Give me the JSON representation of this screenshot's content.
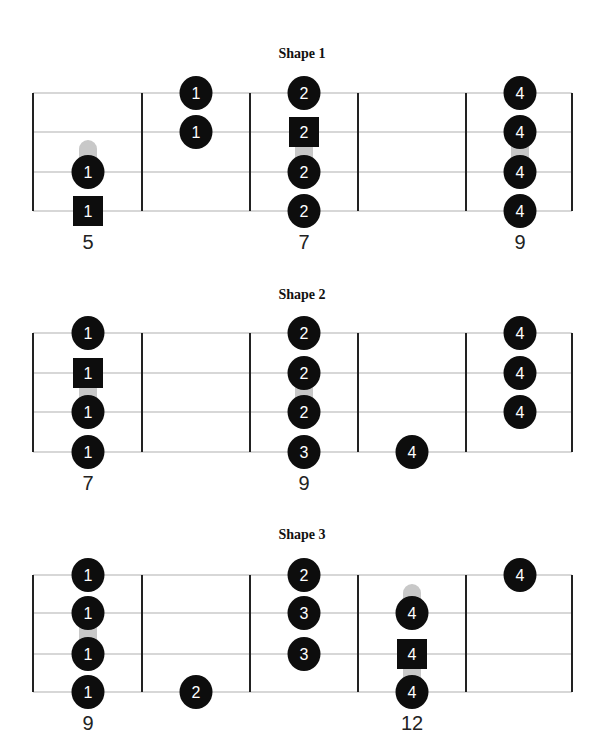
{
  "layout": {
    "fret_x": [
      33,
      142,
      250,
      358,
      466,
      572
    ],
    "column_x": [
      88,
      196,
      304,
      412,
      520
    ],
    "colors": {
      "note": "#0d0d0d",
      "string_line": "#b0b0b0",
      "fret_line": "#222222",
      "slide": "#c8c8c8",
      "note_text": "#ffffff"
    }
  },
  "diagrams": [
    {
      "title": "Shape 1",
      "title_y": 58,
      "strings_y": [
        93,
        132,
        172,
        211
      ],
      "fret_numbers": [
        {
          "col": 0,
          "label": "5"
        },
        {
          "col": 2,
          "label": "7"
        },
        {
          "col": 4,
          "label": "9"
        }
      ],
      "fret_number_y": 249,
      "notes": [
        {
          "col": 1,
          "string": 0,
          "finger": "1",
          "shape": "circle"
        },
        {
          "col": 1,
          "string": 1,
          "finger": "1",
          "shape": "circle"
        },
        {
          "col": 0,
          "string": 2,
          "finger": "1",
          "shape": "circle"
        },
        {
          "col": 0,
          "string": 3,
          "finger": "1",
          "shape": "square"
        },
        {
          "col": 2,
          "string": 0,
          "finger": "2",
          "shape": "circle"
        },
        {
          "col": 2,
          "string": 1,
          "finger": "2",
          "shape": "square"
        },
        {
          "col": 2,
          "string": 2,
          "finger": "2",
          "shape": "circle"
        },
        {
          "col": 2,
          "string": 3,
          "finger": "2",
          "shape": "circle"
        },
        {
          "col": 4,
          "string": 0,
          "finger": "4",
          "shape": "circle"
        },
        {
          "col": 4,
          "string": 1,
          "finger": "4",
          "shape": "circle"
        },
        {
          "col": 4,
          "string": 2,
          "finger": "4",
          "shape": "circle"
        },
        {
          "col": 4,
          "string": 3,
          "finger": "4",
          "shape": "circle"
        }
      ],
      "slides": [
        {
          "col": 0,
          "from_y": 148,
          "to_y": 165
        },
        {
          "col": 2,
          "from_y": 140,
          "to_y": 160
        },
        {
          "col": 4,
          "from_y": 140,
          "to_y": 160
        }
      ]
    },
    {
      "title": "Shape 2",
      "title_y": 299,
      "strings_y": [
        333,
        373,
        412,
        452
      ],
      "fret_numbers": [
        {
          "col": 0,
          "label": "7"
        },
        {
          "col": 2,
          "label": "9"
        }
      ],
      "fret_number_y": 490,
      "notes": [
        {
          "col": 0,
          "string": 0,
          "finger": "1",
          "shape": "circle"
        },
        {
          "col": 0,
          "string": 1,
          "finger": "1",
          "shape": "square"
        },
        {
          "col": 0,
          "string": 2,
          "finger": "1",
          "shape": "circle"
        },
        {
          "col": 0,
          "string": 3,
          "finger": "1",
          "shape": "circle"
        },
        {
          "col": 2,
          "string": 0,
          "finger": "2",
          "shape": "circle"
        },
        {
          "col": 2,
          "string": 1,
          "finger": "2",
          "shape": "circle"
        },
        {
          "col": 2,
          "string": 2,
          "finger": "2",
          "shape": "circle"
        },
        {
          "col": 2,
          "string": 3,
          "finger": "3",
          "shape": "circle"
        },
        {
          "col": 3,
          "string": 3,
          "finger": "4",
          "shape": "circle",
          "offset_y": 0
        },
        {
          "col": 4,
          "string": 0,
          "finger": "4",
          "shape": "circle"
        },
        {
          "col": 4,
          "string": 1,
          "finger": "4",
          "shape": "circle"
        },
        {
          "col": 4,
          "string": 2,
          "finger": "4",
          "shape": "circle"
        }
      ],
      "slides": [
        {
          "col": 0,
          "from_y": 385,
          "to_y": 400
        },
        {
          "col": 2,
          "from_y": 385,
          "to_y": 400
        }
      ]
    },
    {
      "title": "Shape 3",
      "title_y": 539,
      "strings_y": [
        575,
        613,
        654,
        692
      ],
      "fret_numbers": [
        {
          "col": 0,
          "label": "9"
        },
        {
          "col": 3,
          "label": "12"
        }
      ],
      "fret_number_y": 730,
      "notes": [
        {
          "col": 0,
          "string": 0,
          "finger": "1",
          "shape": "circle"
        },
        {
          "col": 0,
          "string": 1,
          "finger": "1",
          "shape": "circle"
        },
        {
          "col": 0,
          "string": 2,
          "finger": "1",
          "shape": "circle"
        },
        {
          "col": 0,
          "string": 3,
          "finger": "1",
          "shape": "circle"
        },
        {
          "col": 1,
          "string": 3,
          "finger": "2",
          "shape": "circle"
        },
        {
          "col": 2,
          "string": 0,
          "finger": "2",
          "shape": "circle"
        },
        {
          "col": 2,
          "string": 1,
          "finger": "3",
          "shape": "circle"
        },
        {
          "col": 2,
          "string": 2,
          "finger": "3",
          "shape": "circle"
        },
        {
          "col": 3,
          "string": 1,
          "finger": "4",
          "shape": "circle"
        },
        {
          "col": 3,
          "string": 2,
          "finger": "4",
          "shape": "square"
        },
        {
          "col": 3,
          "string": 3,
          "finger": "4",
          "shape": "circle"
        },
        {
          "col": 4,
          "string": 0,
          "finger": "4",
          "shape": "circle"
        }
      ],
      "slides": [
        {
          "col": 0,
          "from_y": 626,
          "to_y": 642
        },
        {
          "col": 3,
          "from_y": 592,
          "to_y": 605
        },
        {
          "col": 3,
          "from_y": 668,
          "to_y": 680
        }
      ]
    }
  ]
}
